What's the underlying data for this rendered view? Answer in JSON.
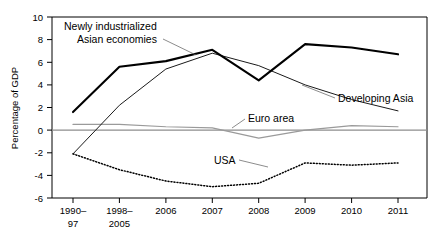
{
  "chart_data": {
    "type": "line",
    "title": "",
    "subtitle": "",
    "xlabel": "",
    "ylabel": "Percentage of GDP",
    "categories": [
      "1990–\n97",
      "1998–\n2005",
      "2006",
      "2007",
      "2008",
      "2009",
      "2010",
      "2011"
    ],
    "category_lines": [
      [
        "1990–",
        "97"
      ],
      [
        "1998–",
        "2005"
      ],
      [
        "2006",
        ""
      ],
      [
        "2007",
        ""
      ],
      [
        "2008",
        ""
      ],
      [
        "2009",
        ""
      ],
      [
        "2010",
        ""
      ],
      [
        "2011",
        ""
      ]
    ],
    "ylim": [
      -6,
      10
    ],
    "yticks": [
      10,
      8,
      6,
      4,
      2,
      0,
      -2,
      -4,
      -6
    ],
    "ytick_labels": [
      "10",
      "8",
      "6",
      "4",
      "2",
      "0",
      "-2",
      "-4",
      "-6"
    ],
    "grid": false,
    "zero_line": true,
    "legend_position": "inline-annotations",
    "series": [
      {
        "name": "Newly industrialized Asian economies",
        "style": "thick-solid-black",
        "color": "#000000",
        "values": [
          1.6,
          5.6,
          6.1,
          7.1,
          4.4,
          7.6,
          7.3,
          6.7
        ],
        "label_text_lines": [
          "Newly industrialized",
          "Asian economies"
        ],
        "label_x": 64,
        "label_y": 26
      },
      {
        "name": "Developing Asia",
        "style": "thin-solid-black",
        "color": "#1a1a1a",
        "values": [
          -2.1,
          2.2,
          5.4,
          6.8,
          5.7,
          4.0,
          2.7,
          1.7
        ],
        "label_text_lines": [
          "Developing Asia"
        ],
        "label_x": 338,
        "label_y": 101
      },
      {
        "name": "Euro area",
        "style": "thin-solid-gray",
        "color": "#9a9a9a",
        "values": [
          0.5,
          0.5,
          0.3,
          0.2,
          -0.7,
          0.0,
          0.4,
          0.3
        ],
        "label_text_lines": [
          "Euro area"
        ],
        "label_x": 248,
        "label_y": 122
      },
      {
        "name": "USA",
        "style": "dotted-black",
        "color": "#000000",
        "values": [
          -2.1,
          -3.5,
          -4.5,
          -5.0,
          -4.7,
          -2.9,
          -3.1,
          -2.9
        ],
        "label_text_lines": [
          "USA"
        ],
        "label_x": 214,
        "label_y": 163
      }
    ]
  },
  "axis": {
    "y_title": "Percentage of GDP"
  },
  "labels": {
    "y_10": "10",
    "y_8": "8",
    "y_6": "6",
    "y_4": "4",
    "y_2": "2",
    "y_0": "0",
    "y_m2": "-2",
    "y_m4": "-4",
    "y_m6": "-6",
    "x0_top": "1990–",
    "x0_bot": "97",
    "x1_top": "1998–",
    "x1_bot": "2005",
    "x2": "2006",
    "x3": "2007",
    "x4": "2008",
    "x5": "2009",
    "x6": "2010",
    "x7": "2011",
    "nia_line1": "Newly industrialized",
    "nia_line2": "Asian economies",
    "dev_asia": "Developing Asia",
    "euro_area": "Euro area",
    "usa": "USA"
  }
}
